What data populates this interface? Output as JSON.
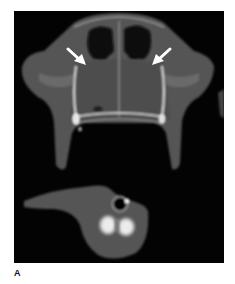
{
  "figure": {
    "panel_label": "A",
    "image_type": "axial CT scan",
    "annotations": [
      {
        "type": "arrow",
        "direction": "down-right",
        "color": "#ffffff"
      },
      {
        "type": "arrow",
        "direction": "down-left",
        "color": "#ffffff"
      }
    ],
    "colors": {
      "background": "#030303",
      "soft_tissue": "#585858",
      "bone": "#e6e6e6",
      "air": "#000000",
      "page": "#ffffff"
    }
  }
}
